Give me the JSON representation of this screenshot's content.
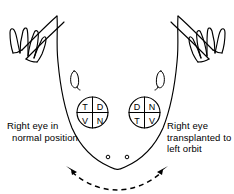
{
  "figure": {
    "ink_color": "#000000",
    "background_color": "#ffffff"
  },
  "eyes": {
    "left_eye": {
      "name": "normal-right-eye",
      "quadrants": {
        "top_left": "T",
        "top_right": "D",
        "bottom_left": "V",
        "bottom_right": "N"
      }
    },
    "right_eye": {
      "name": "transplanted-right-eye",
      "quadrants": {
        "top_left": "D",
        "top_right": "N",
        "bottom_left": "T",
        "bottom_right": "V"
      }
    }
  },
  "captions": {
    "left": {
      "line1": "Right eye in",
      "line2": "normal position"
    },
    "right": {
      "line1": "Right eye",
      "line2": "transplanted to",
      "line3": "left orbit"
    }
  },
  "annotations": {
    "rotation_arrow": "dashed double-headed rotation arrow",
    "nostrils": "paired nostril dots"
  }
}
